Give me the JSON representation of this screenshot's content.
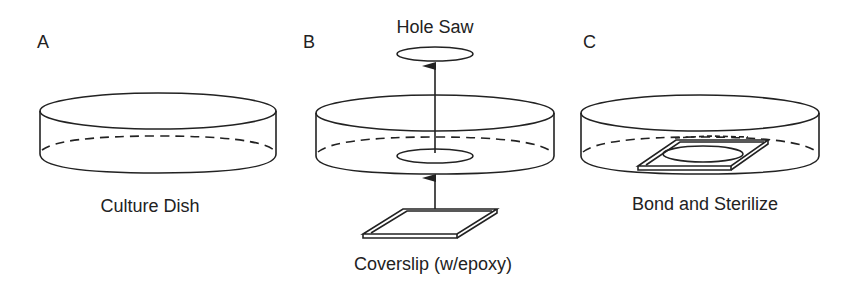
{
  "panels": [
    {
      "letter": "A",
      "caption": "Culture Dish"
    },
    {
      "letter": "B",
      "caption": "Coverslip (w/epoxy)",
      "top_label": "Hole Saw"
    },
    {
      "letter": "C",
      "caption": "Bond and Sterilize"
    }
  ],
  "colors": {
    "line": "#222222",
    "background": "#ffffff"
  }
}
